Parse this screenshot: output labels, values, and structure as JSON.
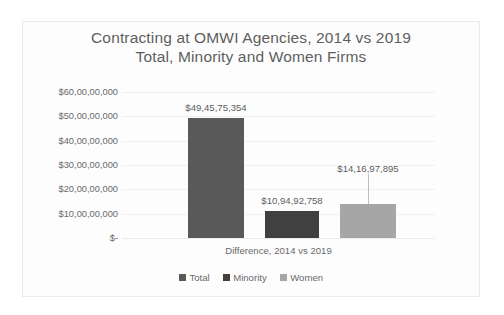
{
  "chart_data": {
    "type": "bar",
    "title": "Contracting at OMWI Agencies, 2014 vs 2019",
    "subtitle": "Total, Minority and Women Firms",
    "xlabel": "Difference, 2014 vs 2019",
    "ylabel": "",
    "categories": [
      "Difference, 2014 vs 2019"
    ],
    "series": [
      {
        "name": "Total",
        "values": [
          494575354
        ],
        "label": "$49,45,75,354",
        "color": "#595959"
      },
      {
        "name": "Minority",
        "values": [
          109492758
        ],
        "label": "$10,94,92,758",
        "color": "#404040"
      },
      {
        "name": "Women",
        "values": [
          141697895
        ],
        "label": "$14,16,97,895",
        "color": "#a6a6a6"
      }
    ],
    "ylim": [
      0,
      600000000
    ],
    "ytick_values": [
      600000000,
      500000000,
      400000000,
      300000000,
      200000000,
      100000000,
      0
    ],
    "ytick_labels": [
      "$60,00,00,000",
      "$50,00,00,000",
      "$40,00,00,000",
      "$30,00,00,000",
      "$20,00,00,000",
      "$10,00,00,000",
      "$-"
    ],
    "grid": true,
    "legend_position": "bottom",
    "legend_entries": [
      "Total",
      "Minority",
      "Women"
    ],
    "annotations": [
      "leader line from Women data label to bar top"
    ]
  },
  "colors": {
    "title_text": "#5f5f5f",
    "axis_text": "#6a6a6a",
    "gridline": "#f0f0f0",
    "frame": "#eaeaea",
    "background": "#fdfdfd",
    "total_bar": "#595959",
    "minority_bar": "#404040",
    "women_bar": "#a6a6a6"
  }
}
